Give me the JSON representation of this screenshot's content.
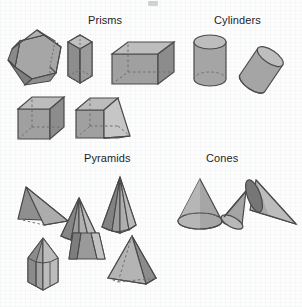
{
  "figure": {
    "title_fragment_visible": false,
    "background_color": "#fdfdfd",
    "width": 302,
    "height": 307
  },
  "palette": {
    "outline": "#4a4a4a",
    "hidden_edge": "#6f6f6f",
    "face_light": "#b9b9b9",
    "face_mid": "#9d9d9d",
    "face_dark": "#7f7f7f",
    "face_darker": "#6b6b6b",
    "label_color": "#1d1d1d"
  },
  "groups": [
    {
      "id": "prisms",
      "label": "Prisms",
      "label_x": 88,
      "label_y": 14,
      "shapes": [
        {
          "id": "hexagonal-prism-flat",
          "name": "hexagonal-prism",
          "x": 6,
          "y": 29
        },
        {
          "id": "hexagonal-prism-tall",
          "name": "hexagonal-prism-upright",
          "x": 62,
          "y": 30
        },
        {
          "id": "rectangular-prism",
          "name": "rectangular-prism",
          "x": 110,
          "y": 40
        },
        {
          "id": "cube",
          "name": "cube",
          "x": 16,
          "y": 95
        },
        {
          "id": "oblique-prism",
          "name": "oblique-prism",
          "x": 74,
          "y": 94
        }
      ]
    },
    {
      "id": "cylinders",
      "label": "Cylinders",
      "label_x": 214,
      "label_y": 14,
      "shapes": [
        {
          "id": "cylinder-upright",
          "name": "right-cylinder",
          "x": 190,
          "y": 33
        },
        {
          "id": "cylinder-oblique",
          "name": "oblique-cylinder",
          "x": 234,
          "y": 45
        }
      ]
    },
    {
      "id": "pyramids",
      "label": "Pyramids",
      "label_x": 84,
      "label_y": 152,
      "shapes": [
        {
          "id": "tetrahedron",
          "name": "triangular-pyramid",
          "x": 14,
          "y": 181
        },
        {
          "id": "pyramid-tall-left",
          "name": "hexagonal-pyramid-tall",
          "x": 57,
          "y": 196
        },
        {
          "id": "pyramid-tall-right",
          "name": "pentagonal-pyramid-tall",
          "x": 96,
          "y": 175
        },
        {
          "id": "hexagonal-pyramid",
          "name": "hexagonal-pyramid",
          "x": 22,
          "y": 236
        },
        {
          "id": "frustum",
          "name": "truncated-pyramid-frustum",
          "x": 67,
          "y": 231
        },
        {
          "id": "square-pyramid",
          "name": "square-pyramid",
          "x": 104,
          "y": 234
        }
      ]
    },
    {
      "id": "cones",
      "label": "Cones",
      "label_x": 206,
      "label_y": 152,
      "shapes": [
        {
          "id": "cone-upright",
          "name": "right-cone",
          "x": 174,
          "y": 177
        },
        {
          "id": "cone-oblique",
          "name": "oblique-cone",
          "x": 218,
          "y": 189
        },
        {
          "id": "cone-sideways",
          "name": "cone-lying-on-side",
          "x": 246,
          "y": 174
        }
      ]
    }
  ]
}
